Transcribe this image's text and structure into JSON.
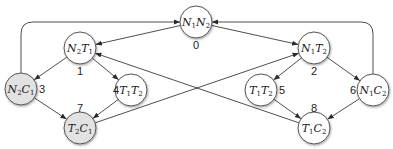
{
  "colors": {
    "white_node": "#ffffff",
    "gray_node": "#e2e2e2",
    "edge": "#3a3a3a"
  },
  "nodes": [
    {
      "id": "0",
      "main1": "N",
      "sub1": "1",
      "main2": "N",
      "sub2": "2",
      "label": "0",
      "cx": 196,
      "cy": 22,
      "fill": "white",
      "lx": 196,
      "ly": 49
    },
    {
      "id": "1",
      "main1": "N",
      "sub1": "2",
      "main2": "T",
      "sub2": "1",
      "label": "1",
      "cx": 80,
      "cy": 48,
      "fill": "white",
      "lx": 80,
      "ly": 75
    },
    {
      "id": "2",
      "main1": "N",
      "sub1": "1",
      "main2": "T",
      "sub2": "2",
      "label": "2",
      "cx": 314,
      "cy": 48,
      "fill": "white",
      "lx": 314,
      "ly": 75
    },
    {
      "id": "3",
      "main1": "N",
      "sub1": "2",
      "main2": "C",
      "sub2": "1",
      "label": "3",
      "cx": 21,
      "cy": 89,
      "fill": "gray",
      "lx": 42,
      "ly": 93
    },
    {
      "id": "4",
      "main1": "T",
      "sub1": "1",
      "main2": "T",
      "sub2": "2",
      "label": "4",
      "cx": 131,
      "cy": 90,
      "fill": "white",
      "lx": 116,
      "ly": 94
    },
    {
      "id": "5",
      "main1": "T",
      "sub1": "1",
      "main2": "T",
      "sub2": "2",
      "label": "5",
      "cx": 261,
      "cy": 90,
      "fill": "white",
      "lx": 282,
      "ly": 94
    },
    {
      "id": "6",
      "main1": "N",
      "sub1": "1",
      "main2": "C",
      "sub2": "2",
      "label": "6",
      "cx": 373,
      "cy": 90,
      "fill": "white",
      "lx": 353,
      "ly": 94
    },
    {
      "id": "7",
      "main1": "T",
      "sub1": "2",
      "main2": "C",
      "sub2": "1",
      "label": "7",
      "cx": 80,
      "cy": 128,
      "fill": "gray",
      "lx": 80,
      "ly": 112
    },
    {
      "id": "8",
      "main1": "T",
      "sub1": "1",
      "main2": "C",
      "sub2": "2",
      "label": "8",
      "cx": 314,
      "cy": 128,
      "fill": "white",
      "lx": 314,
      "ly": 112
    }
  ],
  "edges": [
    {
      "from": "0",
      "to": "1"
    },
    {
      "from": "0",
      "to": "2"
    },
    {
      "from": "1",
      "to": "3"
    },
    {
      "from": "1",
      "to": "4"
    },
    {
      "from": "2",
      "to": "5"
    },
    {
      "from": "2",
      "to": "6"
    },
    {
      "from": "3",
      "to": "7"
    },
    {
      "from": "4",
      "to": "7"
    },
    {
      "from": "5",
      "to": "8"
    },
    {
      "from": "6",
      "to": "8"
    },
    {
      "from": "7",
      "to": "2"
    },
    {
      "from": "8",
      "to": "1"
    },
    {
      "from": "3",
      "to": "0",
      "curved": "left"
    },
    {
      "from": "6",
      "to": "0",
      "curved": "right"
    }
  ]
}
